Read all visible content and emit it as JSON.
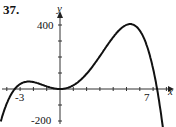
{
  "problem_number": "37.",
  "chart_data": {
    "type": "line",
    "title": "",
    "xlabel": "x",
    "ylabel": "y",
    "x_tick_labels": [
      "-3",
      "7"
    ],
    "y_tick_labels": [
      "400",
      "-200"
    ],
    "x_tick_step": 1,
    "y_tick_step": 100,
    "xlim": [
      -4.5,
      8
    ],
    "ylim": [
      -200,
      420
    ],
    "grid": false,
    "series": [
      {
        "name": "f(x)",
        "x": [
          -4.5,
          -4,
          -3.4,
          -3,
          -2,
          -1,
          0,
          1,
          2,
          3,
          4,
          5,
          5.5,
          6,
          6.5,
          7,
          7.3,
          7.7
        ],
        "values": [
          -150,
          -60,
          0,
          27,
          43,
          20,
          0,
          24,
          120,
          250,
          360,
          400,
          385,
          330,
          220,
          80,
          0,
          -150
        ]
      }
    ],
    "color": "#111111"
  }
}
